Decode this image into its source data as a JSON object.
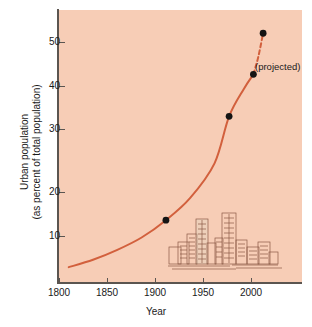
{
  "chart_data": {
    "type": "line",
    "title": "",
    "xlabel": "Year",
    "ylabel": "Urban population (as percent of total population)",
    "ylabel_line1": "Urban population",
    "ylabel_line2": "(as percent of total population)",
    "xlim": [
      1790,
      2040
    ],
    "ylim": [
      0,
      55
    ],
    "xticks": [
      1800,
      1850,
      1900,
      1950,
      2000
    ],
    "xticklabels": [
      "1800",
      "1850",
      "1900",
      "1950",
      "2000"
    ],
    "yticks": [
      10,
      20,
      30,
      40,
      50
    ],
    "yticklabels": [
      "10",
      "20",
      "30",
      "40",
      "50"
    ],
    "grid": false,
    "legend": "none",
    "series": [
      {
        "name": "Urban population trend",
        "style": "solid-curve",
        "color": "#d2603d",
        "x": [
          1800,
          1825,
          1850,
          1875,
          1900,
          1925,
          1950,
          1965,
          1980,
          1990
        ],
        "values": [
          3.0,
          4.5,
          6.5,
          9.0,
          12.5,
          17.0,
          24.0,
          33.5,
          39.0,
          42.0
        ]
      },
      {
        "name": "Projected trend",
        "style": "dashed-curve",
        "color": "#d2603d",
        "x": [
          1990,
          1995,
          2000
        ],
        "values": [
          42.0,
          45.5,
          50.3
        ]
      }
    ],
    "markers": [
      {
        "x": 1900,
        "y": 12.5,
        "label": ""
      },
      {
        "x": 1965,
        "y": 33.5,
        "label": ""
      },
      {
        "x": 1990,
        "y": 42.0,
        "label": ""
      },
      {
        "x": 2000,
        "y": 50.3,
        "label": ""
      }
    ],
    "annotations": [
      {
        "name": "projected-label",
        "text": "(projected)",
        "x": 2005,
        "y": 46
      }
    ],
    "illustration": "city-skyline",
    "colors": {
      "panel_background": "#f7cdb6",
      "curve": "#d2603d",
      "marker": "#141414",
      "axis": "#5b5550",
      "skyline_stroke": "#8a5a46",
      "text": "#1a1a1a"
    }
  },
  "annotation": {
    "projected": "(projected)"
  },
  "axes": {
    "x_title": "Year",
    "y_title_line1": "Urban population",
    "y_title_line2": "(as percent of total population)"
  },
  "ticks": {
    "x": [
      "1800",
      "1850",
      "1900",
      "1950",
      "2000"
    ],
    "y": [
      "10",
      "20",
      "30",
      "40",
      "50"
    ]
  }
}
